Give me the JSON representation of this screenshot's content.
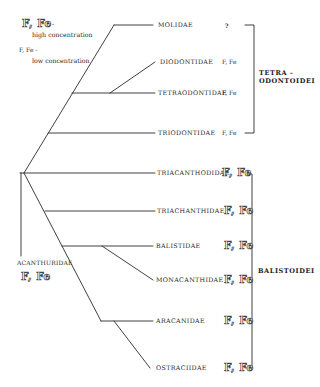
{
  "legend": {
    "high_symbol": "F, Fe",
    "high_suffix": "-",
    "high_text": "high concentration",
    "low_symbol": "F, Fe -",
    "low_text": "low concentration"
  },
  "taxa": [
    {
      "name": "MOLIDAE",
      "value": "?",
      "style": "small"
    },
    {
      "name": "DIODONTIDAE",
      "value": "F, Fe",
      "style": "small"
    },
    {
      "name": "TETRAODONTIDAE",
      "value": "F, Fe",
      "style": "small"
    },
    {
      "name": "TRIODONTIDAE",
      "value": "F, Fe",
      "style": "small"
    },
    {
      "name": "TRIACANTHODIDAE",
      "value": "F, Fe",
      "style": "big"
    },
    {
      "name": "TRIACHANTHIDAE",
      "value": "F, Fe",
      "style": "big"
    },
    {
      "name": "BALISTIDAE",
      "value": "F, Fe",
      "style": "big"
    },
    {
      "name": "MONACANTHIDAE",
      "value": "F, Fe",
      "style": "big"
    },
    {
      "name": "ARACANIDAE",
      "value": "F, Fe",
      "style": "big"
    },
    {
      "name": "OSTRACIIDAE",
      "value": "F, Fe",
      "style": "big"
    }
  ],
  "outgroup": {
    "name": "ACANTHURIDAE",
    "value": "F, Fe",
    "style": "big"
  },
  "groups": {
    "tetraodontoidei_line1": "TETRA -",
    "tetraodontoidei_line2": "ODONTOIDEI",
    "balistoidei": "BALISTOIDEI"
  },
  "colors": {
    "line": "#2b2b2b",
    "background": "#ffffff"
  }
}
